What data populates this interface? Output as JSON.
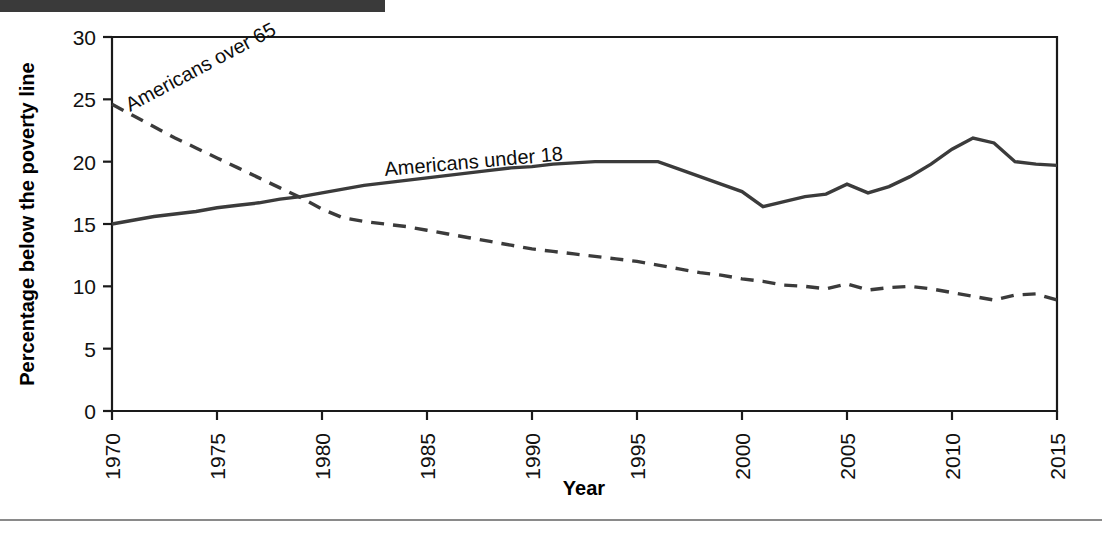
{
  "figure": {
    "background_color": "#ffffff",
    "top_bar_color": "#3a3a3a",
    "rule_color": "#8a8a8a",
    "line_color": "#3b3b3b"
  },
  "chart_data": {
    "type": "line",
    "title": "",
    "subtitle": "",
    "xlabel": "Year",
    "ylabel": "Percentage below the poverty line",
    "xlim": [
      1970,
      2015
    ],
    "ylim": [
      0,
      30
    ],
    "grid": false,
    "legend_position": "inline-annotation",
    "x_ticks": [
      1970,
      1975,
      1980,
      1985,
      1990,
      1995,
      2000,
      2005,
      2010,
      2015
    ],
    "x_tick_labels": [
      "1970",
      "1975",
      "1980",
      "1985",
      "1990",
      "1995",
      "2000",
      "2005",
      "2010",
      "2015"
    ],
    "x_tick_rotation": -90,
    "y_ticks": [
      0,
      5,
      10,
      15,
      20,
      25,
      30
    ],
    "y_tick_labels": [
      "0",
      "5",
      "10",
      "15",
      "20",
      "25",
      "30"
    ],
    "x": [
      1970,
      1971,
      1972,
      1973,
      1974,
      1975,
      1976,
      1977,
      1978,
      1979,
      1980,
      1981,
      1982,
      1983,
      1984,
      1985,
      1986,
      1987,
      1988,
      1989,
      1990,
      1991,
      1992,
      1993,
      1994,
      1995,
      1996,
      1997,
      1998,
      1999,
      2000,
      2001,
      2002,
      2003,
      2004,
      2005,
      2006,
      2007,
      2008,
      2009,
      2010,
      2011,
      2012,
      2013,
      2014,
      2015
    ],
    "series": [
      {
        "name": "Americans under 18",
        "style": "solid",
        "label": "Americans under 18",
        "label_rotation": -5,
        "values": [
          15.0,
          15.3,
          15.6,
          15.8,
          16.0,
          16.3,
          16.5,
          16.7,
          17.0,
          17.2,
          17.5,
          17.8,
          18.1,
          18.3,
          18.5,
          18.7,
          18.9,
          19.1,
          19.3,
          19.5,
          19.6,
          19.8,
          19.9,
          20.0,
          20.0,
          20.0,
          20.0,
          19.4,
          18.8,
          18.2,
          17.6,
          16.4,
          16.8,
          17.2,
          17.4,
          18.2,
          17.5,
          18.0,
          18.8,
          19.8,
          21.0,
          21.9,
          21.5,
          20.0,
          19.8,
          19.7
        ]
      },
      {
        "name": "Americans over 65",
        "style": "dashed",
        "label": "Americans over 65",
        "label_rotation": -28,
        "values": [
          24.6,
          23.7,
          22.8,
          21.9,
          21.1,
          20.3,
          19.5,
          18.7,
          17.9,
          17.1,
          16.2,
          15.5,
          15.2,
          15.0,
          14.8,
          14.5,
          14.2,
          13.9,
          13.6,
          13.3,
          13.0,
          12.8,
          12.6,
          12.4,
          12.2,
          12.0,
          11.7,
          11.4,
          11.1,
          10.9,
          10.6,
          10.4,
          10.1,
          10.0,
          9.8,
          10.2,
          9.7,
          9.9,
          10.0,
          9.8,
          9.5,
          9.2,
          8.9,
          9.3,
          9.4,
          8.9
        ]
      }
    ]
  }
}
